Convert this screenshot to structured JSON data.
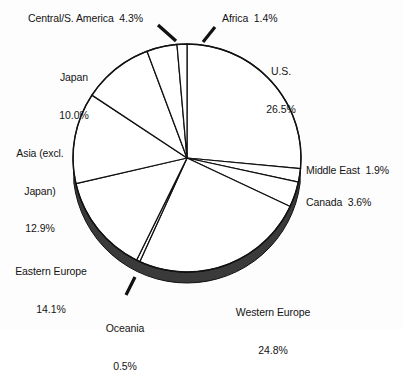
{
  "chart_data": {
    "type": "pie",
    "title": "",
    "subtitle": "",
    "xlabel": "",
    "ylabel": "",
    "legend_position": "none",
    "grid": false,
    "units": "percent",
    "start_angle_deg": 0,
    "direction": "clockwise",
    "categories": [
      "U.S.",
      "Middle East",
      "Canada",
      "Western Europe",
      "Oceania",
      "Eastern Europe",
      "Asia (excl. Japan)",
      "Japan",
      "Central/S. America",
      "Africa"
    ],
    "values": [
      26.5,
      1.9,
      3.6,
      24.8,
      0.5,
      14.1,
      12.9,
      10.0,
      4.3,
      1.4
    ],
    "slices": [
      {
        "name": "U.S.",
        "label_line1": "U.S.",
        "label_line2": "26.5%",
        "value": 26.5,
        "value_text": "26.5%",
        "leader": false
      },
      {
        "name": "Middle East",
        "label_line1": "Middle East  1.9%",
        "label_line2": "",
        "value": 1.9,
        "value_text": "1.9%",
        "leader": false
      },
      {
        "name": "Canada",
        "label_line1": "Canada  3.6%",
        "label_line2": "",
        "value": 3.6,
        "value_text": "3.6%",
        "leader": false
      },
      {
        "name": "Western Europe",
        "label_line1": "Western Europe",
        "label_line2": "24.8%",
        "value": 24.8,
        "value_text": "24.8%",
        "leader": false
      },
      {
        "name": "Oceania",
        "label_line1": "Oceania",
        "label_line2": "0.5%",
        "value": 0.5,
        "value_text": "0.5%",
        "leader": true
      },
      {
        "name": "Eastern Europe",
        "label_line1": "Eastern Europe",
        "label_line2": "14.1%",
        "value": 14.1,
        "value_text": "14.1%",
        "leader": false
      },
      {
        "name": "Asia (excl. Japan)",
        "label_line1": "Asia (excl.",
        "label_line2": "Japan)",
        "label_line3": "12.9%",
        "value": 12.9,
        "value_text": "12.9%",
        "leader": false
      },
      {
        "name": "Japan",
        "label_line1": "Japan",
        "label_line2": "10.0%",
        "value": 10.0,
        "value_text": "10.0%",
        "leader": false
      },
      {
        "name": "Central/S. America",
        "label_line1": "Central/S. America  4.3%",
        "label_line2": "",
        "value": 4.3,
        "value_text": "4.3%",
        "leader": true
      },
      {
        "name": "Africa",
        "label_line1": "Africa  1.4%",
        "label_line2": "",
        "value": 1.4,
        "value_text": "1.4%",
        "leader": true
      }
    ],
    "colors": {
      "slice_fill": "#ffffff",
      "slice_stroke": "#111111",
      "rim_fill": "#3a3a3a",
      "background": "#fdfdfd",
      "text": "#141414"
    }
  },
  "labels": {
    "us_line1": "U.S.",
    "us_line2": "26.5%",
    "middle_east": "Middle East  1.9%",
    "canada": "Canada  3.6%",
    "western_europe_line1": "Western Europe",
    "western_europe_line2": "24.8%",
    "oceania_line1": "Oceania",
    "oceania_line2": "0.5%",
    "eastern_europe_line1": "Eastern Europe",
    "eastern_europe_line2": "14.1%",
    "asia_line1": "Asia (excl.",
    "asia_line2": "Japan)",
    "asia_line3": "12.9%",
    "japan_line1": "Japan",
    "japan_line2": "10.0%",
    "central_s_america": "Central/S. America  4.3%",
    "africa": "Africa  1.4%"
  }
}
